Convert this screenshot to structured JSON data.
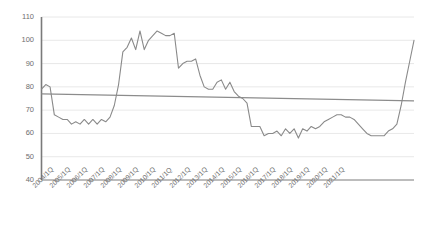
{
  "chart_data": {
    "type": "line",
    "title": "",
    "subtitle": "",
    "xlabel": "",
    "ylabel": "",
    "ylim": [
      40,
      110
    ],
    "ytick_values": [
      40,
      50,
      60,
      70,
      80,
      90,
      100,
      110
    ],
    "ytick_labels": [
      "40",
      "50",
      "60",
      "70",
      "80",
      "90",
      "100",
      "110"
    ],
    "grid": true,
    "grid_axis": "y",
    "legend": false,
    "legend_position": "none",
    "x_tick_labels": [
      "2004/1Q",
      "2005/1Q",
      "2006/1Q",
      "2007/1Q",
      "2008/1Q",
      "2009/1Q",
      "2010/1Q",
      "2011/1Q",
      "2012/1Q",
      "2013/1Q",
      "2014/1Q",
      "2015/1Q",
      "2016/1Q",
      "2017/1Q",
      "2018/1Q",
      "2019/1Q",
      "2020/1Q",
      "2021/1Q"
    ],
    "x_tick_indices": [
      0,
      4,
      8,
      12,
      16,
      20,
      24,
      28,
      32,
      36,
      40,
      44,
      48,
      52,
      56,
      60,
      64,
      68
    ],
    "x_period_labels": [
      "2004/1Q",
      "2004/2Q",
      "2004/3Q",
      "2004/4Q",
      "2005/1Q",
      "2005/2Q",
      "2005/3Q",
      "2005/4Q",
      "2006/1Q",
      "2006/2Q",
      "2006/3Q",
      "2006/4Q",
      "2007/1Q",
      "2007/2Q",
      "2007/3Q",
      "2007/4Q",
      "2008/1Q",
      "2008/2Q",
      "2008/3Q",
      "2008/4Q",
      "2009/1Q",
      "2009/2Q",
      "2009/3Q",
      "2009/4Q",
      "2010/1Q",
      "2010/2Q",
      "2010/3Q",
      "2010/4Q",
      "2011/1Q",
      "2011/2Q",
      "2011/3Q",
      "2011/4Q",
      "2012/1Q",
      "2012/2Q",
      "2012/3Q",
      "2012/4Q",
      "2013/1Q",
      "2013/2Q",
      "2013/3Q",
      "2013/4Q",
      "2014/1Q",
      "2014/2Q",
      "2014/3Q",
      "2014/4Q",
      "2015/1Q",
      "2015/2Q",
      "2015/3Q",
      "2015/4Q",
      "2016/1Q",
      "2016/2Q",
      "2016/3Q",
      "2016/4Q",
      "2017/1Q",
      "2017/2Q",
      "2017/3Q",
      "2017/4Q",
      "2018/1Q",
      "2018/2Q",
      "2018/3Q",
      "2018/4Q",
      "2019/1Q",
      "2019/2Q",
      "2019/3Q",
      "2019/4Q",
      "2020/1Q",
      "2020/2Q",
      "2020/3Q",
      "2020/4Q",
      "2021/1Q",
      "2021/2Q",
      "2021/3Q",
      "2021/4Q"
    ],
    "series": [
      {
        "name": "index",
        "color": "#808080",
        "width": 1.1,
        "values": [
          79,
          81,
          80,
          68,
          67,
          66,
          66,
          64,
          65,
          64,
          66,
          64,
          66,
          64,
          66,
          65,
          67,
          72,
          81,
          95,
          97,
          101,
          96,
          104,
          96,
          100,
          102,
          104,
          103,
          102,
          102,
          103,
          88,
          90,
          91,
          91,
          92,
          85,
          80,
          79,
          79,
          82,
          83,
          79,
          82,
          78,
          76,
          75,
          73,
          63,
          63,
          63,
          59,
          60,
          60,
          61,
          59,
          62,
          60,
          62,
          58,
          62,
          61,
          63,
          62,
          63,
          65,
          66,
          67,
          68,
          68,
          67
        ]
      },
      {
        "name": "trend",
        "color": "#8c8c8c",
        "width": 1.1,
        "values": [
          77,
          74
        ]
      }
    ],
    "series_extended_tail": {
      "name": "index-tail",
      "note": "continuation of index series after 2021/1Q",
      "values": [
        67,
        66,
        64,
        62,
        60,
        59,
        59,
        59,
        59,
        61,
        62,
        64,
        72,
        82,
        91,
        100
      ]
    },
    "axis_color": "#7a7a7a",
    "grid_color": "#e2e2e2",
    "line_color": "#8a8a8a",
    "trend_color": "#8c8c8c",
    "background": "#ffffff"
  }
}
